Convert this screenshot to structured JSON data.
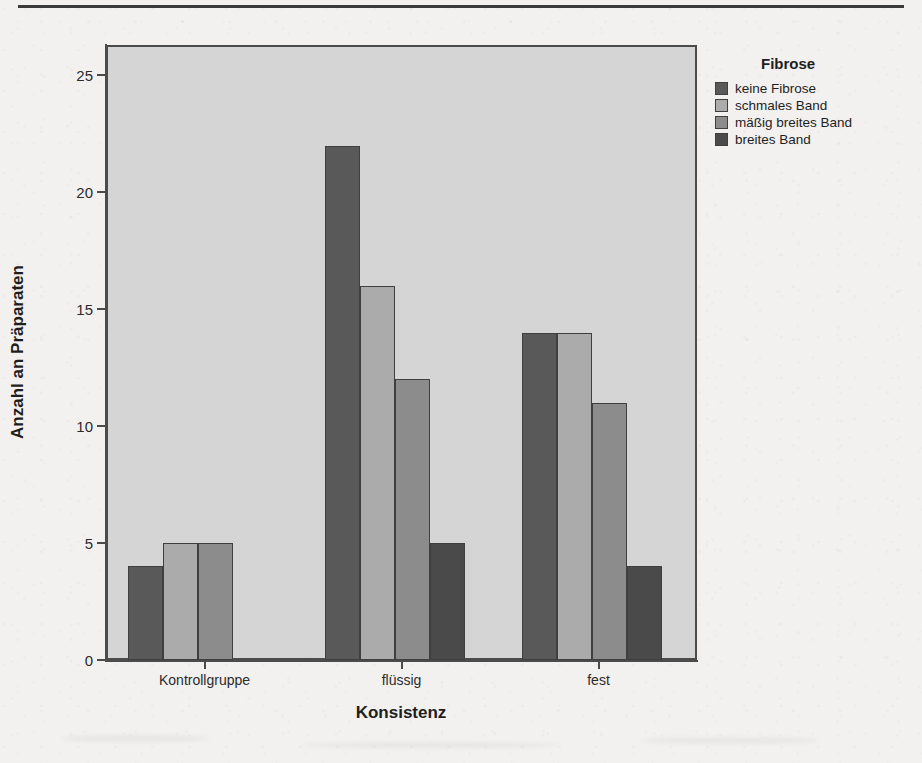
{
  "chart_data": {
    "type": "bar",
    "title": "",
    "xlabel": "Konsistenz",
    "ylabel": "Anzahl an Präparaten",
    "categories": [
      "Kontrollgruppe",
      "flüssig",
      "fest"
    ],
    "ylim": [
      0,
      26.3
    ],
    "yticks": [
      0,
      5,
      10,
      15,
      20,
      25
    ],
    "ytick_labels": [
      "0",
      "5",
      "10",
      "15",
      "20",
      "25"
    ],
    "grid": false,
    "legend_title": "Fibrose",
    "legend_position": "right-top",
    "series": [
      {
        "name": "keine Fibrose",
        "color": "#595959",
        "values": [
          4,
          22,
          14
        ]
      },
      {
        "name": "schmales Band",
        "color": "#ababab",
        "values": [
          5,
          16,
          14
        ]
      },
      {
        "name": "mäßig breites Band",
        "color": "#8c8c8c",
        "values": [
          5,
          12,
          11
        ]
      },
      {
        "name": "breites Band",
        "color": "#4a4a4a",
        "values": [
          null,
          5,
          4
        ]
      }
    ]
  },
  "style": {
    "plot_background": "#d5d5d5",
    "page_background": "#f2f1ef",
    "axis_color": "#4b4b4b",
    "bar_outline": "#3f3f3f"
  }
}
